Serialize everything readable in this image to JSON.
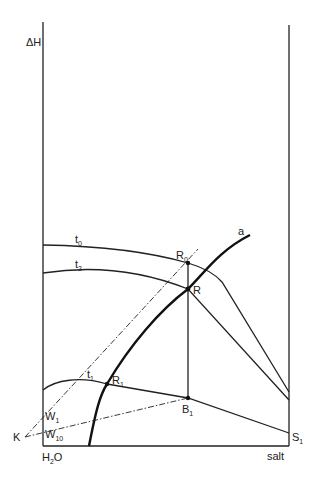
{
  "diagram": {
    "type": "enthalpy-concentration diagram",
    "axes": {
      "y_label": "ΔH",
      "x_left_label": "H",
      "x_left_sub": "2",
      "x_left_suffix": "O",
      "x_right_label": "salt"
    },
    "curves": [
      {
        "id": "t0",
        "label": "t",
        "sub": "0"
      },
      {
        "id": "t2",
        "label": "t",
        "sub": "2"
      },
      {
        "id": "t1",
        "label": "t",
        "sub": "1"
      },
      {
        "id": "a",
        "label": "a"
      }
    ],
    "points": [
      {
        "id": "R0",
        "label": "R",
        "sub": "0"
      },
      {
        "id": "R",
        "label": "R",
        "sub": ""
      },
      {
        "id": "R1",
        "label": "R",
        "sub": "1"
      },
      {
        "id": "B1",
        "label": "B",
        "sub": "1"
      },
      {
        "id": "S1",
        "label": "S",
        "sub": "1"
      },
      {
        "id": "W1",
        "label": "W",
        "sub": "1"
      },
      {
        "id": "W10",
        "label": "W",
        "sub": "10"
      },
      {
        "id": "K",
        "label": "K",
        "sub": ""
      }
    ]
  }
}
